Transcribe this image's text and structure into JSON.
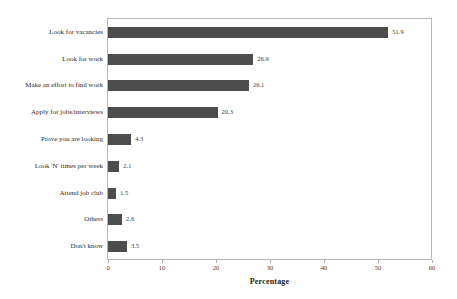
{
  "chart_data": {
    "type": "bar",
    "orientation": "horizontal",
    "title": "",
    "xlabel": "Percentage",
    "ylabel": "",
    "xlim": [
      0,
      60
    ],
    "xticks": [
      0,
      10,
      20,
      30,
      40,
      50,
      60
    ],
    "xtick_labels": [
      "0",
      "10",
      "20",
      "30",
      "40",
      "50",
      "60"
    ],
    "grid": false,
    "legend": null,
    "bar_color": "#4d4d4d",
    "frame_color": "#b8b8b8",
    "categories": [
      "Look for vacancies",
      "Look for work",
      "Make an effort to find work",
      "Apply for jobs/interviews",
      "Prove you are looking",
      "Look 'N' times per week",
      "Attend job club",
      "Others",
      "Don't know"
    ],
    "values": [
      51.9,
      26.9,
      26.1,
      20.3,
      4.3,
      2.1,
      1.5,
      2.6,
      3.5
    ],
    "value_labels": [
      "51.9",
      "26.9",
      "26.1",
      "20.3",
      "4.3",
      "2.1",
      "1.5",
      "2.6",
      "3.5"
    ]
  }
}
